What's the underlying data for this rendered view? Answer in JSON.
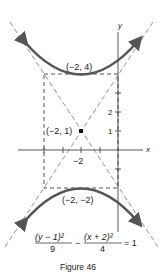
{
  "figure": {
    "caption": "Figure 46",
    "equation": {
      "term1_num": "(y − 1)²",
      "term1_den": "9",
      "minus": "−",
      "term2_num": "(x + 2)²",
      "term2_den": "4",
      "rhs": "= 1"
    },
    "axes": {
      "x_label": "x",
      "y_label": "y"
    },
    "ticks": {
      "x_label": "−2",
      "y_labels": [
        "1",
        "2"
      ]
    },
    "points": {
      "center": "(−2, 1)",
      "top_vertex": "(−2, 4)",
      "bottom_vertex": "(−2, −2)"
    },
    "colors": {
      "curve": "#555555",
      "axis": "#444444",
      "dashed": "#666666",
      "text": "#222222"
    }
  }
}
